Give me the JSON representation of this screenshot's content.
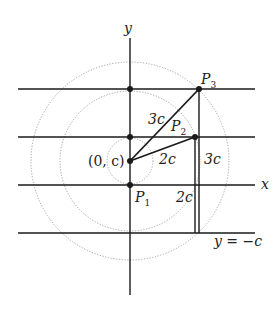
{
  "diagram": {
    "type": "geometry-construction",
    "axes": {
      "x_label": "x",
      "y_label": "y"
    },
    "points": {
      "center": {
        "label": "(0, c)"
      },
      "P1": {
        "label": "P",
        "sub": "1"
      },
      "P2": {
        "label": "P",
        "sub": "2"
      },
      "P3": {
        "label": "P",
        "sub": "3"
      }
    },
    "segment_labels": {
      "center_to_P3": "3c",
      "center_to_P2": "2c",
      "P3_to_directrix": "3c",
      "P2_to_directrix": "2c"
    },
    "directrix_label": "y = −c",
    "circles": [
      {
        "name": "inner",
        "radius_label": "c"
      },
      {
        "name": "middle",
        "radius_label": "2c"
      },
      {
        "name": "outer",
        "radius_label": "3c"
      }
    ],
    "horizontal_lines": [
      "y = 3c-level",
      "y = 2c-level",
      "x-axis",
      "y = −c"
    ],
    "colors": {
      "line": "#1a1a1a",
      "circle": "#9a9a9a"
    }
  }
}
